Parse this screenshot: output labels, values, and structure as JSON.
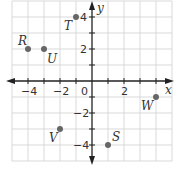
{
  "figure": {
    "x_axis_label": "x",
    "y_axis_label": "y",
    "origin_label": "0",
    "x_ticks": [
      {
        "value": -4,
        "label": "−4"
      },
      {
        "value": -2,
        "label": "−2"
      },
      {
        "value": 2,
        "label": "2"
      }
    ],
    "y_ticks": [
      {
        "value": 4,
        "label": "4"
      },
      {
        "value": 2,
        "label": "2"
      },
      {
        "value": -2,
        "label": "−2"
      },
      {
        "value": -4,
        "label": "−4"
      }
    ],
    "grid_range": {
      "xmin": -5,
      "xmax": 5,
      "ymin": -5,
      "ymax": 5
    },
    "points": [
      {
        "name": "R",
        "x": -4,
        "y": 2
      },
      {
        "name": "U",
        "x": -3,
        "y": 2
      },
      {
        "name": "T",
        "x": -1,
        "y": 4
      },
      {
        "name": "V",
        "x": -2,
        "y": -3
      },
      {
        "name": "S",
        "x": 1,
        "y": -4
      },
      {
        "name": "W",
        "x": 4,
        "y": -1
      }
    ],
    "colors": {
      "grid": "#d9d9d9",
      "axis": "#222222",
      "point": "#666666"
    }
  }
}
